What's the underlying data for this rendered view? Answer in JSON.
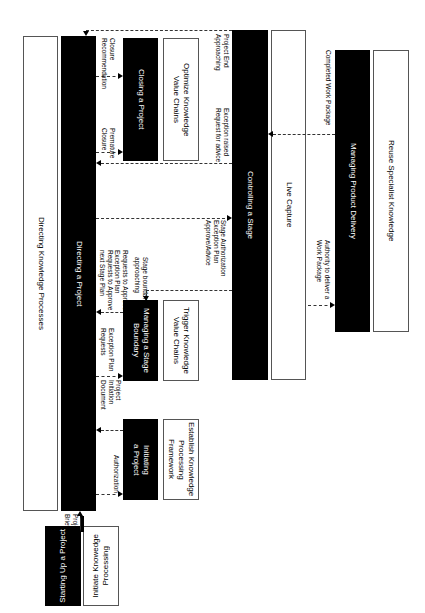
{
  "diagram": {
    "orientation": "rotated 90 degrees clockwise",
    "processes": {
      "starting_up": "Starting Up a Project",
      "directing": "Directing a Project",
      "initiating": "Initiating\na Project",
      "managing_stage_boundary": "Managing a Stage\nBoundary",
      "closing": "Closing a Project",
      "controlling_stage": "Controlling a Stage",
      "managing_product_delivery": "Managing Product Delivery"
    },
    "knowledge_processes": {
      "initiate": "Initiate Knowedge\nProcessing",
      "directing": "Directing Knowledge Processes",
      "establish": "Establish Knowledge\nProcessing Framework",
      "trigger": "Trigger Knowledge\nValue Chains",
      "optimize": "Optimize Knowledge\nValue Chains",
      "live_capture": "Live Capture",
      "reuse": "Reuse Specialist Knowledge"
    },
    "flows": {
      "project_brief": "Project\nBrief",
      "authorization": "Authorization",
      "project_initiation_document": "Project\nInitiation\nDocument",
      "exception_plan_requests": "Exception Plan\nRequests",
      "requests_to_approve": "Requests to Approve\nException Plan\nRequests to Approve\nnext Stage Plan",
      "stage_boundary_approaching": "Stage boundary\napproaching",
      "premature_closure": "Premature\nClosure",
      "closure_recommendation": "Closure\nRecommendation",
      "stage_authorization": "Stage Authorization\nException Plan\nApprove/Advice",
      "exception_raised": "Exception raised\nRequest for advice",
      "project_end_approaching": "Project End\nApproaching",
      "authority_to_deliver": "Authority to deliver a\nWork Package",
      "completed_work_package": "Completed Work Package"
    }
  }
}
